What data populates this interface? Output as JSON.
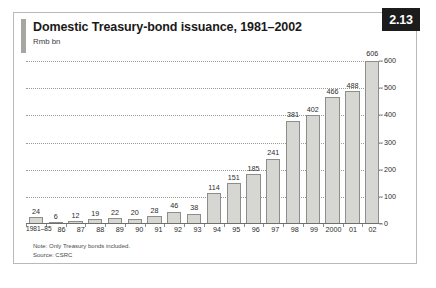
{
  "figure": {
    "badge_label": "2.13",
    "title": "Domestic Treasury-bond issuance, 1981–2002",
    "subtitle": "Rmb bn",
    "note": "Note: Only Treasury bonds included.",
    "source": "Source: CSRC",
    "colors": {
      "bar_fill": "#d6d6d2",
      "bar_stroke": "#8d8d89",
      "badge_bg": "#1c1c1c",
      "badge_text": "#ffffff",
      "frame": "#b9b9b6",
      "accent": "#a6a6a2",
      "gridline": "#9a9a96"
    }
  },
  "chart_data": {
    "type": "bar",
    "title": "Domestic Treasury-bond issuance, 1981–2002",
    "subtitle": "Rmb bn",
    "xlabel": "",
    "ylabel": "Rmb bn",
    "ylim": [
      0,
      600
    ],
    "yticks": [
      0,
      100,
      200,
      300,
      400,
      500,
      600
    ],
    "grid": true,
    "y_axis_position": "right",
    "legend": "none",
    "data_labels": true,
    "categories": [
      "1981–85",
      "86",
      "87",
      "88",
      "89",
      "90",
      "91",
      "92",
      "93",
      "94",
      "95",
      "96",
      "97",
      "98",
      "99",
      "2000",
      "01",
      "02"
    ],
    "values": [
      24,
      6,
      12,
      19,
      22,
      20,
      28,
      46,
      38,
      114,
      151,
      185,
      241,
      381,
      402,
      466,
      488,
      606
    ]
  }
}
